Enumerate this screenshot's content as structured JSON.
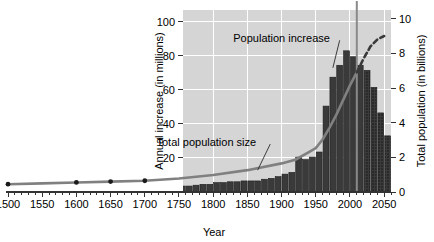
{
  "chart_data": {
    "type": "bar",
    "title": "",
    "subtitle": "",
    "xlabel": "Year",
    "ylabel": "Annual increase (in millions)",
    "y2label": "Total population (in billions)",
    "xlim": [
      1500,
      2060
    ],
    "ylim": [
      0,
      107
    ],
    "y2lim": [
      0,
      10.5
    ],
    "grid": true,
    "legend_position": "inline-annotations",
    "x_ticks": [
      1500,
      1550,
      1600,
      1650,
      1700,
      1750,
      1800,
      1850,
      1900,
      1950,
      2000,
      2050
    ],
    "x_tick_labels": [
      "1500",
      "1550",
      "1600",
      "1650",
      "1700",
      "1750",
      "1800",
      "1850",
      "1900",
      "1950",
      "2000",
      "2050"
    ],
    "x_minor_tick_step": 10,
    "y_ticks": [
      20,
      40,
      60,
      80,
      100
    ],
    "y_tick_labels": [
      "20",
      "40",
      "60",
      "80",
      "100"
    ],
    "y2_ticks": [
      0,
      2,
      4,
      6,
      8,
      10
    ],
    "y2_tick_labels": [
      "0",
      "2",
      "4",
      "6",
      "8",
      "10"
    ],
    "plot_bg_color": "#d5d5d5",
    "gridline_color": "#ffffff",
    "bar_color": "#3a3a3a",
    "bar_projected_color": "#3a3a3a",
    "line_color": "#808080",
    "marker_color": "#1a1a1a",
    "reference_line_color": "#8a8a8a",
    "reference_line_year": 2010,
    "projection_start_year": 2015,
    "annotations": [
      {
        "text": "Population increase",
        "target_series": "annual_increase_bars",
        "x": 1900,
        "y": 88,
        "leader_to_x": 1975,
        "leader_to_y": 73
      },
      {
        "text": "Total population size",
        "target_series": "total_population_line",
        "x": 1790,
        "y": 27,
        "leader_to_x": 1865,
        "leader_to_y": 11
      }
    ],
    "series": [
      {
        "name": "Population increase",
        "axis": "left",
        "unit": "millions per year",
        "type": "bar",
        "bar_start_year": 1750,
        "bar_step_years": 10,
        "categories": [
          1750,
          1760,
          1770,
          1780,
          1790,
          1800,
          1810,
          1820,
          1830,
          1840,
          1850,
          1860,
          1870,
          1880,
          1890,
          1900,
          1910,
          1920,
          1930,
          1940,
          1950,
          1960,
          1970,
          1980,
          1990,
          2000,
          2010,
          2020,
          2030,
          2040,
          2050
        ],
        "values": [
          3.5,
          3.5,
          4.0,
          4.5,
          4.5,
          5.5,
          5.5,
          6.0,
          6.0,
          6.5,
          6.5,
          6.5,
          7.5,
          8.0,
          9.0,
          10.5,
          11.5,
          20.5,
          19.0,
          20.5,
          23.5,
          50.5,
          67.5,
          74.5,
          83.0,
          79.5,
          74.5,
          71.5,
          61.5,
          46.5,
          33.0
        ],
        "projected_from_index": 27,
        "projected_years": [
          2020,
          2030,
          2040,
          2050
        ]
      },
      {
        "name": "Total population size",
        "axis": "right",
        "unit": "billions",
        "type": "line",
        "x": [
          1500,
          1550,
          1600,
          1650,
          1700,
          1750,
          1800,
          1850,
          1900,
          1920,
          1940,
          1950,
          1960,
          1970,
          1980,
          1990,
          2000,
          2010,
          2020,
          2030,
          2040,
          2050
        ],
        "values": [
          0.45,
          0.5,
          0.55,
          0.6,
          0.65,
          0.78,
          0.98,
          1.26,
          1.65,
          1.86,
          2.3,
          2.53,
          3.03,
          3.7,
          4.45,
          5.3,
          6.15,
          6.9,
          7.7,
          8.4,
          8.8,
          9.0
        ],
        "markers_at_x": [
          1500,
          1600,
          1650,
          1700
        ],
        "projected_from_x": 2010,
        "solid_until_x": 2010
      }
    ]
  }
}
